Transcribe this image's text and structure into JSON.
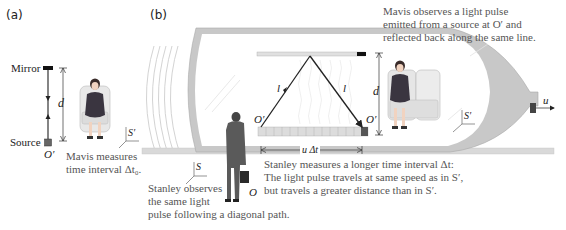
{
  "panels": {
    "a": {
      "label": "(a)",
      "mirror_label": "Mirror",
      "source_label": "Source",
      "origin_label": "O′",
      "distance_label": "d",
      "frame_label": "S′",
      "caption_line1": "Mavis measures",
      "caption_line2": "time interval Δt₀."
    },
    "b": {
      "label": "(b)",
      "mavis_caption_line1": "Mavis observes a light pulse",
      "mavis_caption_line2": "emitted from a source at O′ and",
      "mavis_caption_line3": "reflected back along the same line.",
      "path_label_left": "l",
      "path_label_right": "l",
      "origin_left": "O′",
      "origin_right": "O′",
      "distance_label": "d",
      "displacement_label": "u Δt",
      "velocity_label": "u",
      "frame_moving_label": "S′",
      "frame_ground_label": "S",
      "ground_origin_label": "O",
      "stanley_caption_line1": "Stanley observes",
      "stanley_caption_line2": "the same light",
      "stanley_caption_line3": "pulse following a diagonal path.",
      "stanley_measure_line1": "Stanley measures a longer time interval Δt:",
      "stanley_measure_line2": "The light pulse travels at same speed as in S′,",
      "stanley_measure_line3": "but travels a greater distance than in S′."
    }
  },
  "colors": {
    "train_body": "#c8c8c8",
    "train_interior": "#ffffff",
    "rail": "#d9d9d9",
    "light_path": "#222222",
    "caption_text": "#555555",
    "dress": "#3a3540",
    "seat": "#e6e6e6",
    "man_suit": "#5a5a5a"
  }
}
